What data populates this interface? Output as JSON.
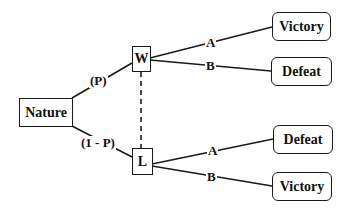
{
  "diagram": {
    "type": "decision-tree",
    "root": {
      "label": "Nature"
    },
    "chance_branches": [
      {
        "label": "(P)",
        "to": "W"
      },
      {
        "label": "(1 - P)",
        "to": "L"
      }
    ],
    "nodes": {
      "W": {
        "label": "W"
      },
      "L": {
        "label": "L"
      }
    },
    "info_set_link": "dashed line between W and L",
    "outcomes": {
      "W_A": {
        "action": "A",
        "result": "Victory"
      },
      "W_B": {
        "action": "B",
        "result": "Defeat"
      },
      "L_A": {
        "action": "A",
        "result": "Defeat"
      },
      "L_B": {
        "action": "B",
        "result": "Victory"
      }
    }
  }
}
